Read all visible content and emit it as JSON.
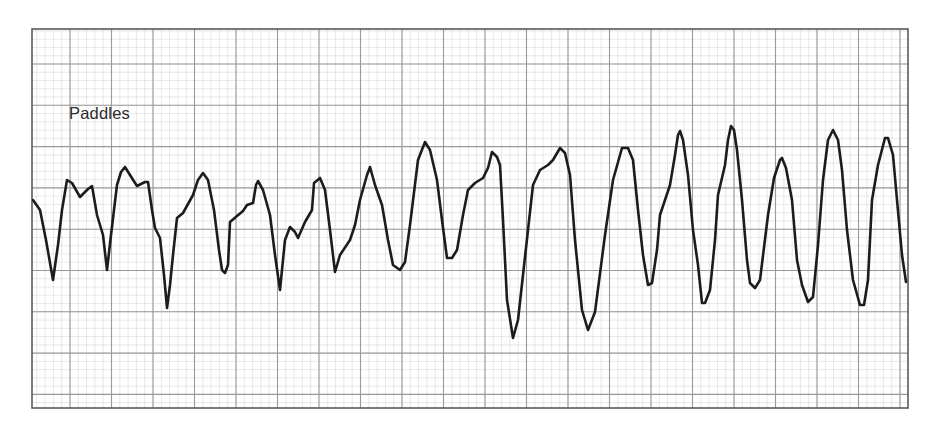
{
  "strip": {
    "label": "Paddles",
    "paper_color": "#ffffff",
    "minor_grid_color": "#d9d9d9",
    "major_grid_color": "#9a9a9a",
    "border_color": "#5a5a5a",
    "trace_color": "#1c1c1c",
    "bounds": {
      "x0": 32,
      "y0": 29,
      "x1": 908,
      "y1": 408
    },
    "grid": {
      "major_x_start": 70,
      "major_x_step": 41.5,
      "major_y_start": 64,
      "major_y_step": 41.3,
      "minor_divisions": 5
    }
  },
  "chart_data": {
    "type": "line",
    "title": "",
    "annotations": [
      "Paddles"
    ],
    "xlabel": "",
    "ylabel": "",
    "grid": true,
    "legend": null,
    "coordinate_space": "pixels (x right, y down)",
    "series": [
      {
        "name": "Paddles",
        "points": [
          [
            33,
            200
          ],
          [
            40,
            210
          ],
          [
            46,
            240
          ],
          [
            53,
            280
          ],
          [
            58,
            245
          ],
          [
            62,
            210
          ],
          [
            67,
            180
          ],
          [
            72,
            183
          ],
          [
            80,
            197
          ],
          [
            88,
            189
          ],
          [
            92,
            186
          ],
          [
            97,
            215
          ],
          [
            103,
            235
          ],
          [
            107,
            270
          ],
          [
            111,
            235
          ],
          [
            117,
            185
          ],
          [
            121,
            172
          ],
          [
            125,
            167
          ],
          [
            130,
            175
          ],
          [
            137,
            186
          ],
          [
            145,
            182
          ],
          [
            148,
            182
          ],
          [
            152,
            210
          ],
          [
            155,
            228
          ],
          [
            160,
            238
          ],
          [
            164,
            275
          ],
          [
            167,
            308
          ],
          [
            170,
            285
          ],
          [
            173,
            255
          ],
          [
            177,
            218
          ],
          [
            183,
            213
          ],
          [
            193,
            195
          ],
          [
            198,
            180
          ],
          [
            203,
            173
          ],
          [
            208,
            180
          ],
          [
            214,
            210
          ],
          [
            219,
            250
          ],
          [
            222,
            270
          ],
          [
            225,
            273
          ],
          [
            228,
            265
          ],
          [
            230,
            222
          ],
          [
            237,
            216
          ],
          [
            243,
            211
          ],
          [
            247,
            205
          ],
          [
            253,
            203
          ],
          [
            256,
            185
          ],
          [
            258,
            181
          ],
          [
            263,
            190
          ],
          [
            270,
            215
          ],
          [
            275,
            255
          ],
          [
            280,
            290
          ],
          [
            285,
            240
          ],
          [
            290,
            227
          ],
          [
            295,
            232
          ],
          [
            298,
            238
          ],
          [
            305,
            222
          ],
          [
            312,
            210
          ],
          [
            314,
            183
          ],
          [
            320,
            178
          ],
          [
            325,
            190
          ],
          [
            330,
            230
          ],
          [
            335,
            272
          ],
          [
            340,
            255
          ],
          [
            350,
            240
          ],
          [
            355,
            225
          ],
          [
            360,
            200
          ],
          [
            367,
            175
          ],
          [
            370,
            167
          ],
          [
            375,
            185
          ],
          [
            382,
            205
          ],
          [
            388,
            240
          ],
          [
            393,
            265
          ],
          [
            400,
            270
          ],
          [
            405,
            262
          ],
          [
            410,
            225
          ],
          [
            418,
            160
          ],
          [
            425,
            142
          ],
          [
            430,
            150
          ],
          [
            437,
            180
          ],
          [
            442,
            220
          ],
          [
            447,
            258
          ],
          [
            452,
            258
          ],
          [
            457,
            250
          ],
          [
            463,
            215
          ],
          [
            468,
            190
          ],
          [
            475,
            183
          ],
          [
            483,
            178
          ],
          [
            488,
            168
          ],
          [
            492,
            152
          ],
          [
            497,
            157
          ],
          [
            500,
            165
          ],
          [
            503,
            220
          ],
          [
            507,
            300
          ],
          [
            513,
            338
          ],
          [
            518,
            320
          ],
          [
            523,
            275
          ],
          [
            528,
            230
          ],
          [
            533,
            185
          ],
          [
            540,
            170
          ],
          [
            548,
            165
          ],
          [
            553,
            160
          ],
          [
            560,
            148
          ],
          [
            565,
            153
          ],
          [
            570,
            175
          ],
          [
            575,
            240
          ],
          [
            582,
            310
          ],
          [
            588,
            330
          ],
          [
            595,
            312
          ],
          [
            605,
            235
          ],
          [
            613,
            180
          ],
          [
            622,
            148
          ],
          [
            628,
            148
          ],
          [
            633,
            160
          ],
          [
            638,
            210
          ],
          [
            643,
            255
          ],
          [
            648,
            285
          ],
          [
            652,
            283
          ],
          [
            657,
            250
          ],
          [
            660,
            215
          ],
          [
            665,
            200
          ],
          [
            670,
            185
          ],
          [
            675,
            155
          ],
          [
            678,
            135
          ],
          [
            680,
            131
          ],
          [
            683,
            140
          ],
          [
            688,
            175
          ],
          [
            693,
            230
          ],
          [
            698,
            265
          ],
          [
            702,
            303
          ],
          [
            705,
            303
          ],
          [
            710,
            290
          ],
          [
            715,
            240
          ],
          [
            718,
            195
          ],
          [
            725,
            165
          ],
          [
            728,
            140
          ],
          [
            731,
            126
          ],
          [
            734,
            130
          ],
          [
            737,
            150
          ],
          [
            742,
            200
          ],
          [
            747,
            260
          ],
          [
            750,
            283
          ],
          [
            755,
            288
          ],
          [
            760,
            280
          ],
          [
            768,
            215
          ],
          [
            774,
            178
          ],
          [
            780,
            160
          ],
          [
            782,
            158
          ],
          [
            786,
            168
          ],
          [
            792,
            200
          ],
          [
            797,
            260
          ],
          [
            802,
            285
          ],
          [
            808,
            302
          ],
          [
            813,
            297
          ],
          [
            818,
            245
          ],
          [
            823,
            180
          ],
          [
            828,
            140
          ],
          [
            833,
            130
          ],
          [
            838,
            140
          ],
          [
            842,
            170
          ],
          [
            847,
            230
          ],
          [
            853,
            280
          ],
          [
            860,
            305
          ],
          [
            864,
            305
          ],
          [
            868,
            280
          ],
          [
            872,
            200
          ],
          [
            878,
            165
          ],
          [
            885,
            138
          ],
          [
            888,
            138
          ],
          [
            893,
            155
          ],
          [
            897,
            200
          ],
          [
            902,
            255
          ],
          [
            906,
            282
          ]
        ]
      }
    ]
  }
}
